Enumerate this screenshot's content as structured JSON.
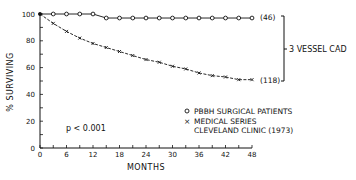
{
  "chart_data": {
    "type": "line",
    "title": "",
    "xlabel": "MONTHS",
    "ylabel": "% SURVIVING",
    "xlim": [
      0,
      48
    ],
    "ylim": [
      0,
      100
    ],
    "x_ticks": [
      0,
      6,
      12,
      18,
      24,
      30,
      36,
      42,
      48
    ],
    "y_ticks": [
      0,
      20,
      40,
      60,
      80,
      100
    ],
    "grid": false,
    "legend_position": "lower right",
    "series": [
      {
        "name": "PBBH SURGICAL PATIENTS",
        "marker": "circle",
        "end_label": "(46)",
        "x": [
          0,
          3,
          6,
          9,
          12,
          15,
          18,
          21,
          24,
          27,
          30,
          33,
          36,
          39,
          42,
          45,
          48
        ],
        "values": [
          100,
          100,
          100,
          100,
          100,
          97,
          97,
          97,
          97,
          97,
          97,
          97,
          97,
          97,
          97,
          97,
          97
        ]
      },
      {
        "name": "MEDICAL SERIES CLEVELAND CLINIC (1973)",
        "marker": "x",
        "end_label": "(118)",
        "x": [
          0,
          3,
          6,
          9,
          12,
          15,
          18,
          21,
          24,
          27,
          30,
          33,
          36,
          39,
          42,
          45,
          48
        ],
        "values": [
          100,
          93,
          87,
          82,
          78,
          75,
          72,
          69,
          66,
          64,
          61,
          59,
          56,
          54,
          53,
          51,
          51
        ]
      }
    ],
    "annotations": [
      {
        "text": "p < 0.001"
      },
      {
        "text": "3 VESSEL CAD",
        "type": "bracket",
        "spans": [
          "(46)",
          "(118)"
        ]
      }
    ]
  },
  "labels": {
    "xlabel": "MONTHS",
    "ylabel": "% SURVIVING",
    "pvalue": "p < 0.001",
    "bracket": "3 VESSEL CAD",
    "legend": [
      {
        "symbol": "o",
        "text": "PBBH SURGICAL PATIENTS"
      },
      {
        "symbol": "×",
        "text": "MEDICAL SERIES"
      },
      {
        "symbol": "",
        "text": "CLEVELAND CLINIC (1973)"
      }
    ],
    "end_labels": [
      "(46)",
      "(118)"
    ],
    "x_ticks": [
      "0",
      "6",
      "12",
      "18",
      "24",
      "30",
      "36",
      "42",
      "48"
    ],
    "y_ticks": [
      "0",
      "20",
      "40",
      "60",
      "80",
      "100"
    ]
  }
}
